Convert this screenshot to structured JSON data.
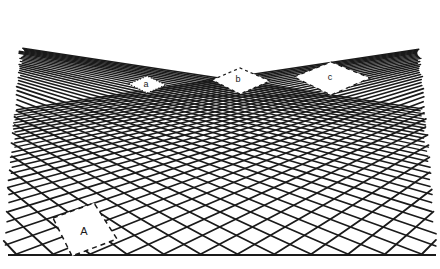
{
  "figure": {
    "type": "perspective-grid-diagram",
    "background_color": "#ffffff",
    "line_color": "#1a1a1a",
    "label_color": "#1a1a1a",
    "line_width_near": 1.9,
    "line_width_far": 1.1
  },
  "canvas": {
    "width": 440,
    "height": 269
  },
  "geometry": {
    "description": "Two-point perspective. Square tiles rotated 45 degrees in ground plane; two families of parallel lines converge to a left and a right vanishing point lying on the horizon line.",
    "horizon_y": 13,
    "vanishing_point_left": {
      "x": -210,
      "y": 13
    },
    "vanishing_point_right": {
      "x": 660,
      "y": 13
    },
    "baseline_y": 255,
    "baseline_x_start": 8,
    "baseline_x_end": 436,
    "station_point": {
      "x": 222,
      "y": 13
    },
    "eye_distance": 240,
    "tile_side": 1.0,
    "lines_family_left_count": 26,
    "lines_family_right_count": 26,
    "grid_top_clip_y": 14,
    "grid_left_clip_x": 20,
    "grid_right_clip_x": 420
  },
  "highlighted_cells": [
    {
      "id": "a",
      "label": "a",
      "label_size": "small",
      "label_x": 146,
      "label_y": 84,
      "depth_row": 14,
      "column": -1,
      "dash": "1,2",
      "corners": [
        [
          129,
          84
        ],
        [
          147,
          76
        ],
        [
          166,
          85
        ],
        [
          147,
          93
        ]
      ]
    },
    {
      "id": "b",
      "label": "b",
      "label_size": "small",
      "label_x": 238,
      "label_y": 79,
      "depth_row": 14,
      "column": 3,
      "dash": "3,3",
      "corners": [
        [
          212,
          80
        ],
        [
          240,
          68
        ],
        [
          270,
          81
        ],
        [
          240,
          94
        ]
      ]
    },
    {
      "id": "c",
      "label": "c",
      "label_size": "small",
      "label_x": 330,
      "label_y": 77,
      "depth_row": 14,
      "column": 7,
      "dash": "4,4",
      "corners": [
        [
          294,
          77
        ],
        [
          331,
          62
        ],
        [
          370,
          78
        ],
        [
          331,
          95
        ]
      ]
    },
    {
      "id": "A",
      "label": "A",
      "label_size": "large",
      "label_x": 84,
      "label_y": 231,
      "depth_row": 1,
      "column": -4,
      "dash": "5,4",
      "corners": [
        [
          53,
          218
        ],
        [
          94,
          203
        ],
        [
          117,
          239
        ],
        [
          72,
          256
        ]
      ]
    }
  ],
  "labels": {
    "a": "a",
    "b": "b",
    "c": "c",
    "A": "A"
  },
  "annotations": {
    "baseline_name": "ground-baseline",
    "note": "Cells a, b and c lie on the same depth row near the horizon; cell A lies in the near foreground."
  }
}
